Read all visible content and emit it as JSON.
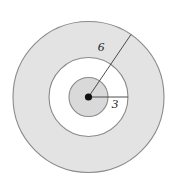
{
  "figure": {
    "type": "concentric-circles-diagram",
    "caption": "",
    "background_color": "#ffffff",
    "canvas": {
      "width": 181,
      "height": 188
    },
    "center": {
      "x": 88.5,
      "y": 97.0
    },
    "center_dot": {
      "label": "center-point",
      "radius": 3.6,
      "color": "#111111"
    },
    "circles": [
      {
        "name": "outer-circle",
        "radius_px": 75.5,
        "fill": "#e3e3e3",
        "stroke": "#8a8a8a",
        "stroke_width": 1.1,
        "measured_value": "6"
      },
      {
        "name": "middle-circle",
        "radius_px": 39.5,
        "fill": "#ffffff",
        "stroke": "#8a8a8a",
        "stroke_width": 1.1,
        "measured_value": "3"
      },
      {
        "name": "inner-circle",
        "radius_px": 19.5,
        "fill": "#d9d9d9",
        "stroke": "#8a8a8a",
        "stroke_width": 1.1,
        "measured_value": ""
      }
    ],
    "radii": [
      {
        "name": "outer-radius-line",
        "label": "6",
        "label_x": 101,
        "label_y": 48,
        "from": {
          "x": 88.5,
          "y": 97.0
        },
        "to": {
          "x": 131.0,
          "y": 34.5
        },
        "stroke": "#3a3a3a",
        "stroke_width": 0.9
      },
      {
        "name": "inner-radius-line",
        "label": "3",
        "label_x": 115,
        "label_y": 105,
        "from": {
          "x": 88.5,
          "y": 97.0
        },
        "to": {
          "x": 128.0,
          "y": 97.0
        },
        "stroke": "#3a3a3a",
        "stroke_width": 0.9
      }
    ]
  },
  "chart_data": {
    "type": "diagram",
    "title": "",
    "labels": [
      "6",
      "3"
    ],
    "values": [
      6,
      3
    ],
    "radii_px": [
      75.5,
      39.5,
      19.5
    ],
    "shaded_regions": [
      "outer-annulus",
      "inner-disc"
    ],
    "unshaded_regions": [
      "middle-annulus"
    ]
  }
}
